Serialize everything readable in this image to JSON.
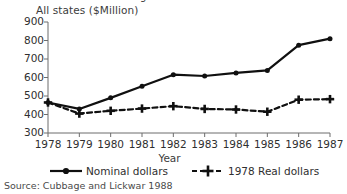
{
  "figure": {
    "clipped_top_title": "Figure continued",
    "source_note": "Source: Cubbage and Lickwar 1988"
  },
  "chart_data": {
    "type": "line",
    "title": "",
    "ylabel": "All states ($Million)",
    "xlabel": "Year",
    "x": [
      1978,
      1979,
      1980,
      1981,
      1982,
      1983,
      1984,
      1985,
      1986,
      1987
    ],
    "xtick_labels": [
      "1978",
      "1979",
      "1980",
      "1981",
      "1982",
      "1983",
      "1984",
      "1985",
      "1986",
      "1987"
    ],
    "ytick_labels": [
      "900",
      "800",
      "700",
      "600",
      "500",
      "400",
      "300"
    ],
    "ytick_values": [
      900,
      800,
      700,
      600,
      500,
      400,
      300
    ],
    "ylim": [
      300,
      900
    ],
    "grid": false,
    "legend_position": "below",
    "series": [
      {
        "name": "Nominal dollars",
        "marker": "circle",
        "line_style": "solid",
        "color": "#101010",
        "values": [
          465,
          430,
          490,
          553,
          615,
          608,
          625,
          638,
          775,
          810
        ]
      },
      {
        "name": "1978 Real dollars",
        "marker": "plus",
        "line_style": "dashed",
        "color": "#101010",
        "values": [
          465,
          405,
          420,
          432,
          445,
          430,
          427,
          415,
          480,
          483
        ]
      }
    ]
  }
}
